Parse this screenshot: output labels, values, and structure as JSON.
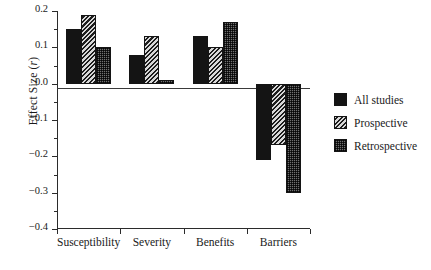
{
  "chart_data": {
    "type": "bar",
    "title": "",
    "xlabel": "",
    "ylabel": "Effect Size (r)",
    "ylabel_prefix": "Effect Size (",
    "ylabel_italic": "r",
    "ylabel_suffix": ")",
    "categories": [
      "Susceptibility",
      "Severity",
      "Benefits",
      "Barriers"
    ],
    "series": [
      {
        "name": "All studies",
        "pattern": "solid",
        "values": [
          0.15,
          0.08,
          0.13,
          -0.21
        ]
      },
      {
        "name": "Prospective",
        "pattern": "hatch",
        "values": [
          0.19,
          0.13,
          0.1,
          -0.17
        ]
      },
      {
        "name": "Retrospective",
        "pattern": "dot",
        "values": [
          0.1,
          0.01,
          0.17,
          -0.3
        ]
      }
    ],
    "ylim": [
      -0.4,
      0.2
    ],
    "ytick_values": [
      0.2,
      0.1,
      0.0,
      -0.1,
      -0.2,
      -0.3,
      -0.4
    ],
    "ytick_labels": [
      "0.2",
      "0.1",
      "0.0",
      "−0.1",
      "−0.2",
      "−0.3",
      "−0.4"
    ],
    "yminor_values": [
      0.15,
      0.05,
      -0.05,
      -0.15,
      -0.25,
      -0.35
    ],
    "grid": false,
    "zero_line": true,
    "legend_position": "right",
    "colors": {
      "solid": "#141414",
      "hatch": "#1d1d1d",
      "dot": "#8d8d8d",
      "axis": "#2b2b2b",
      "background": "#ffffff",
      "text": "#1a1a1a"
    }
  },
  "legend": {
    "items": [
      {
        "label": "All studies",
        "pattern": "solid"
      },
      {
        "label": "Prospective",
        "pattern": "hatch"
      },
      {
        "label": "Retrospective",
        "pattern": "dot"
      }
    ]
  }
}
